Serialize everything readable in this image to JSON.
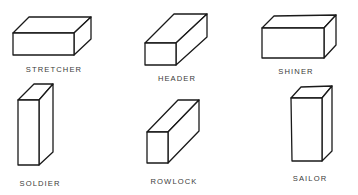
{
  "diagram": {
    "colors": {
      "stroke": "#1a1a1a",
      "label": "#3a3a3a",
      "background": "#ffffff"
    },
    "bricks": [
      {
        "name": "stretcher",
        "label": "STRETCHER",
        "front": [
          [
            13,
            33
          ],
          [
            74,
            33
          ],
          [
            74,
            55
          ],
          [
            13,
            55
          ]
        ],
        "top": [
          [
            13,
            33
          ],
          [
            29,
            17
          ],
          [
            91,
            17
          ],
          [
            74,
            33
          ]
        ],
        "side": [
          [
            74,
            33
          ],
          [
            91,
            17
          ],
          [
            91,
            39
          ],
          [
            74,
            55
          ]
        ],
        "label_pos": [
          54,
          72
        ]
      },
      {
        "name": "header",
        "label": "HEADER",
        "front": [
          [
            145,
            43
          ],
          [
            176,
            43
          ],
          [
            176,
            65
          ],
          [
            145,
            65
          ]
        ],
        "top": [
          [
            145,
            43
          ],
          [
            174,
            14
          ],
          [
            207,
            14
          ],
          [
            176,
            43
          ]
        ],
        "side": [
          [
            176,
            43
          ],
          [
            207,
            14
          ],
          [
            207,
            37
          ],
          [
            176,
            65
          ]
        ],
        "label_pos": [
          177,
          81
        ]
      },
      {
        "name": "shiner",
        "label": "SHINER",
        "front": [
          [
            262,
            28
          ],
          [
            324,
            28
          ],
          [
            324,
            58
          ],
          [
            262,
            58
          ]
        ],
        "top": [
          [
            262,
            28
          ],
          [
            274,
            16
          ],
          [
            336,
            15
          ],
          [
            324,
            28
          ]
        ],
        "side": [
          [
            324,
            28
          ],
          [
            336,
            15
          ],
          [
            336,
            45
          ],
          [
            324,
            58
          ]
        ],
        "label_pos": [
          296,
          74
        ]
      },
      {
        "name": "soldier",
        "label": "SOLDIER",
        "front": [
          [
            18,
            100
          ],
          [
            39,
            100
          ],
          [
            39,
            165
          ],
          [
            18,
            165
          ]
        ],
        "top": [
          [
            18,
            100
          ],
          [
            34,
            84
          ],
          [
            53,
            84
          ],
          [
            39,
            100
          ]
        ],
        "side": [
          [
            39,
            100
          ],
          [
            53,
            84
          ],
          [
            53,
            152
          ],
          [
            39,
            165
          ]
        ],
        "label_pos": [
          40,
          186
        ]
      },
      {
        "name": "rowlock",
        "label": "ROWLOCK",
        "front": [
          [
            147,
            132
          ],
          [
            168,
            132
          ],
          [
            168,
            163
          ],
          [
            147,
            163
          ]
        ],
        "top": [
          [
            147,
            132
          ],
          [
            178,
            100
          ],
          [
            199,
            100
          ],
          [
            168,
            132
          ]
        ],
        "side": [
          [
            168,
            132
          ],
          [
            199,
            100
          ],
          [
            199,
            131
          ],
          [
            168,
            163
          ]
        ],
        "label_pos": [
          174,
          184
        ]
      },
      {
        "name": "sailor",
        "label": "SAILOR",
        "front": [
          [
            291,
            98
          ],
          [
            322,
            98
          ],
          [
            322,
            161
          ],
          [
            292,
            161
          ]
        ],
        "top": [
          [
            291,
            98
          ],
          [
            301,
            87
          ],
          [
            332,
            86
          ],
          [
            322,
            98
          ]
        ],
        "side": [
          [
            322,
            98
          ],
          [
            332,
            86
          ],
          [
            332,
            151
          ],
          [
            322,
            161
          ]
        ],
        "label_pos": [
          310,
          181
        ]
      }
    ]
  }
}
